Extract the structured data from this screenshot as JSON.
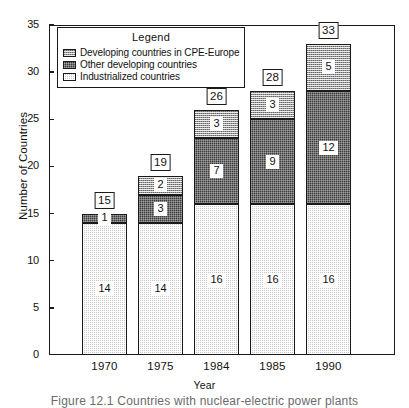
{
  "chart_data": {
    "type": "bar",
    "stacked": true,
    "title": "",
    "xlabel": "Year",
    "ylabel": "Number of Countries",
    "categories": [
      "1970",
      "1975",
      "1984",
      "1985",
      "1990"
    ],
    "ylim": [
      0,
      35
    ],
    "ytick_step": 5,
    "yticks": [
      "0",
      "5",
      "10",
      "15",
      "20",
      "25",
      "30",
      "35"
    ],
    "grid": false,
    "legend_position": "upper-left-inside",
    "series": [
      {
        "name": "Industrialized countries",
        "key": "industrialized",
        "values": [
          14,
          14,
          16,
          16,
          16
        ],
        "color": "#c9c9c9",
        "pattern": "light-checker"
      },
      {
        "name": "Other developing countries",
        "key": "other_developing",
        "values": [
          1,
          3,
          7,
          9,
          12
        ],
        "color": "#3a3a3a",
        "pattern": "dark-checker"
      },
      {
        "name": "Developing countries in CPE-Europe",
        "key": "cpe_europe",
        "values": [
          0,
          2,
          3,
          3,
          5
        ],
        "color": "#9a9a9a",
        "pattern": "medium-checker"
      }
    ],
    "totals": [
      15,
      19,
      26,
      28,
      33
    ]
  },
  "legend": {
    "title": "Legend",
    "items": [
      {
        "label": "Developing countries in CPE-Europe",
        "swatch": "medium-checker"
      },
      {
        "label": "Other developing countries",
        "swatch": "dark-checker"
      },
      {
        "label": "Industrialized countries",
        "swatch": "light-checker"
      }
    ]
  },
  "axes": {
    "y_title": "Number of Countries",
    "x_title": "Year"
  },
  "caption": "Figure 12.1  Countries with nuclear-electric power plants"
}
